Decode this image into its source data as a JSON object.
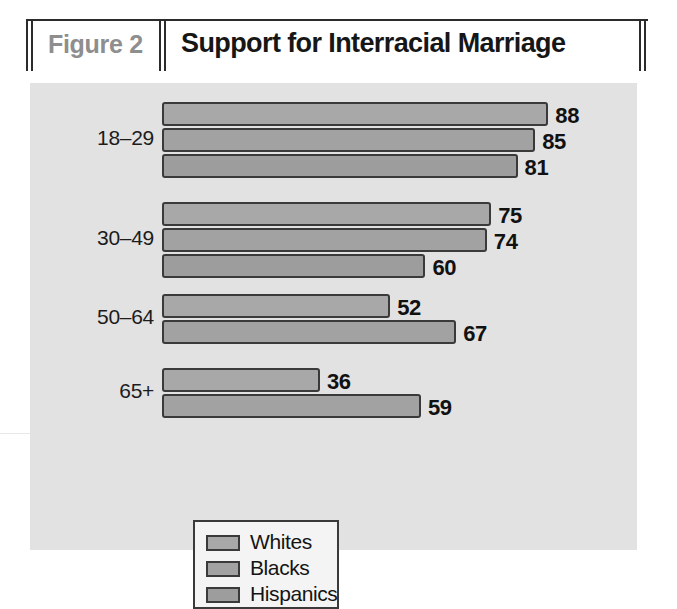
{
  "header": {
    "figure_label": "Figure 2",
    "title": "Support for Interracial Marriage"
  },
  "legend": {
    "position": "inside-bottom-left",
    "entries": [
      "Whites",
      "Blacks",
      "Hispanics"
    ]
  },
  "axis_labels": [
    "18–29",
    "30–49",
    "50–64",
    "65+"
  ],
  "chart_data": {
    "type": "bar",
    "orientation": "horizontal",
    "title": "Support for Interracial Marriage",
    "subtitle": "Figure 2",
    "xlabel": "",
    "ylabel": "",
    "grid": false,
    "legend_position": "inside-bottom-left",
    "xlim": [
      0,
      100
    ],
    "categories": [
      "18–29",
      "30–49",
      "50–64",
      "65+"
    ],
    "series": [
      {
        "name": "Whites",
        "values": [
          88,
          75,
          52,
          36
        ]
      },
      {
        "name": "Blacks",
        "values": [
          85,
          74,
          67,
          59
        ]
      },
      {
        "name": "Hispanics",
        "values": [
          81,
          60,
          null,
          null
        ]
      }
    ],
    "bars": [
      {
        "group": "18–29",
        "series": "Whites",
        "value": 88,
        "label": "88"
      },
      {
        "group": "18–29",
        "series": "Blacks",
        "value": 85,
        "label": "85"
      },
      {
        "group": "18–29",
        "series": "Hispanics",
        "value": 81,
        "label": "81"
      },
      {
        "group": "30–49",
        "series": "Whites",
        "value": 75,
        "label": "75"
      },
      {
        "group": "30–49",
        "series": "Blacks",
        "value": 74,
        "label": "74"
      },
      {
        "group": "30–49",
        "series": "Hispanics",
        "value": 60,
        "label": "60"
      },
      {
        "group": "50–64",
        "series": "Whites",
        "value": 52,
        "label": "52"
      },
      {
        "group": "50–64",
        "series": "Blacks",
        "value": 67,
        "label": "67"
      },
      {
        "group": "65+",
        "series": "Whites",
        "value": 36,
        "label": "36"
      },
      {
        "group": "65+",
        "series": "Blacks",
        "value": 59,
        "label": "59"
      }
    ]
  },
  "colors": {
    "panel_background": "#e2e2e2",
    "bar_fill": "#a3a3a3",
    "bar_outline": "#3a3a3a",
    "figure_label_text": "#8e8e8e",
    "title_text": "#161616",
    "legend_background": "#f4f4f4"
  }
}
